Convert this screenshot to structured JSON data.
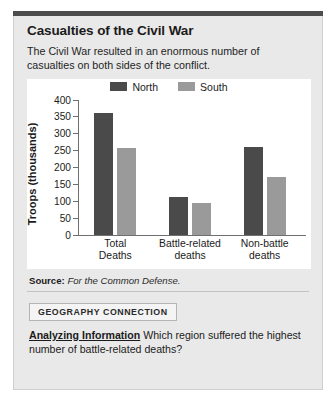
{
  "figure": {
    "title": "Casualties of the Civil War",
    "description": "The Civil War resulted in an enormous number of casualties on both sides of the conflict.",
    "source_label": "Source:",
    "source_text": "For the Common Defense."
  },
  "connection": {
    "badge": "GEOGRAPHY CONNECTION",
    "question_lead": "Analyzing Information",
    "question_text": "Which region suffered the highest number of battle-related deaths?"
  },
  "colors": {
    "north": "#4a4a4a",
    "south": "#9a9a9a",
    "card_bg": "#e9e9e9",
    "plot_bg": "#ffffff",
    "top_rule": "#4d4d4d",
    "axis": "#6f6f6f"
  },
  "chart_data": {
    "type": "bar",
    "title": "Casualties of the Civil War",
    "xlabel": "",
    "ylabel": "Troops (thousands)",
    "ylim": [
      0,
      400
    ],
    "yticks": [
      0,
      50,
      100,
      150,
      200,
      250,
      300,
      350,
      400
    ],
    "grid": false,
    "legend_position": "top-center",
    "categories": [
      "Total Deaths",
      "Battle-related deaths",
      "Non-battle deaths"
    ],
    "category_lines": [
      [
        "Total",
        "Deaths"
      ],
      [
        "Battle-related",
        "deaths"
      ],
      [
        "Non-battle",
        "deaths"
      ]
    ],
    "series": [
      {
        "name": "North",
        "color": "#4a4a4a",
        "values": [
          360,
          110,
          260
        ]
      },
      {
        "name": "South",
        "color": "#9a9a9a",
        "values": [
          258,
          94,
          172
        ]
      }
    ]
  }
}
